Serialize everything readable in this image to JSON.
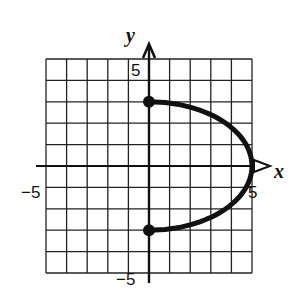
{
  "chart_data": {
    "type": "line",
    "title": "",
    "xlabel": "x",
    "ylabel": "y",
    "xlim": [
      -5,
      5
    ],
    "ylim": [
      -5,
      5
    ],
    "grid": true,
    "grid_step": 1,
    "tick_labels": {
      "x": [
        {
          "value": -5,
          "label": "−5"
        },
        {
          "value": 5,
          "label": "5"
        }
      ],
      "y": [
        {
          "value": 5,
          "label": "5"
        },
        {
          "value": -5,
          "label": "−5"
        }
      ]
    },
    "series": [
      {
        "name": "right half of ellipse x²/25 + y²/9 = 1",
        "description": "Curve from (0,3) through (5,0) to (0,-3)",
        "points": [
          [
            0,
            3
          ],
          [
            1,
            2.94
          ],
          [
            2,
            2.75
          ],
          [
            3,
            2.4
          ],
          [
            4,
            1.8
          ],
          [
            4.5,
            1.31
          ],
          [
            5,
            0
          ],
          [
            4.5,
            -1.31
          ],
          [
            4,
            -1.8
          ],
          [
            3,
            -2.4
          ],
          [
            2,
            -2.75
          ],
          [
            1,
            -2.94
          ],
          [
            0,
            -3
          ]
        ],
        "endpoints": [
          {
            "x": 0,
            "y": 3,
            "closed": true
          },
          {
            "x": 0,
            "y": -3,
            "closed": true
          }
        ]
      }
    ]
  },
  "labels": {
    "x_axis": "x",
    "y_axis": "y",
    "x_min": "−5",
    "x_max": "5",
    "y_max": "5",
    "y_min": "−5"
  },
  "colors": {
    "ink": "#111111",
    "grid": "#222222",
    "background": "#ffffff"
  }
}
